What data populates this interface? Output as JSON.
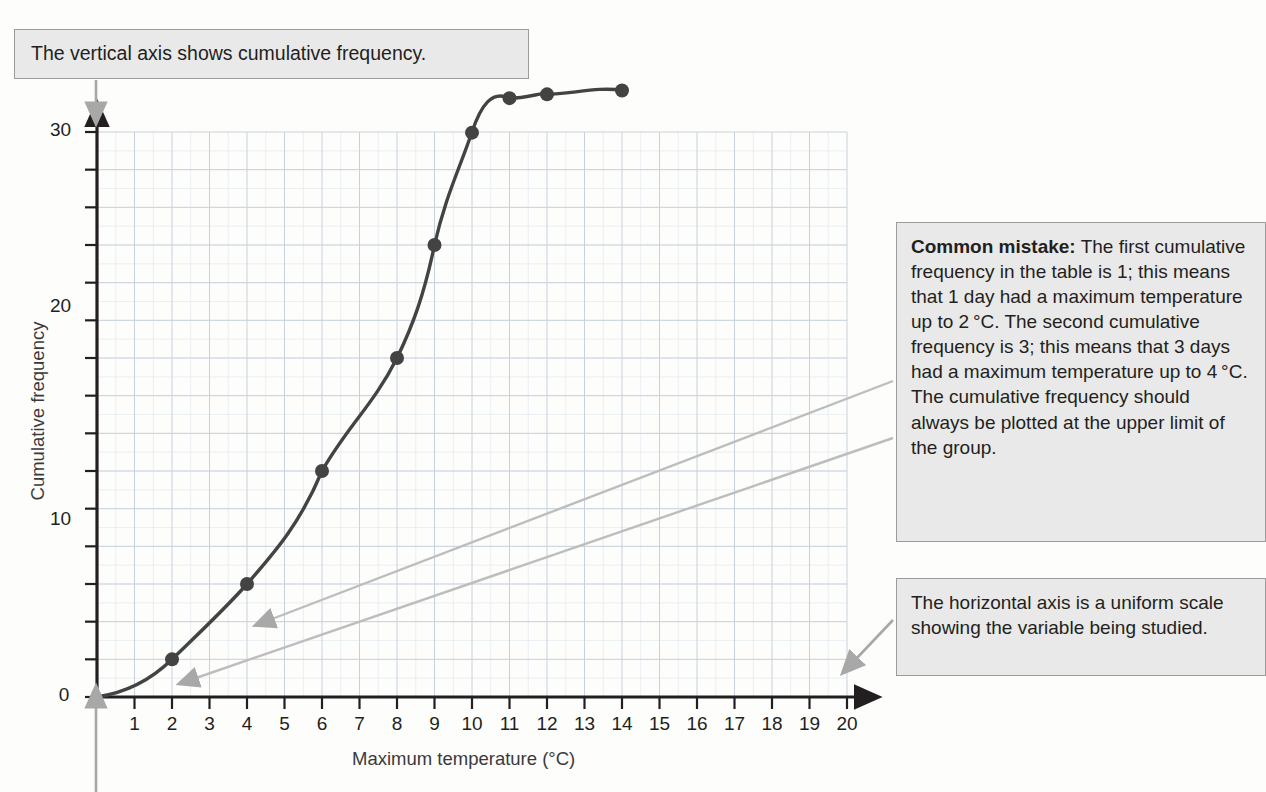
{
  "callouts": {
    "top": "The vertical axis shows cumulative frequency.",
    "mistake_label": "Common mistake:",
    "mistake_body": " The first cumulative frequency in the table is 1; this means that 1 day had a maximum temperature up to 2 °C. The second cumulative frequency is 3; this means that 3 days had a maximum temperature up to 4 °C. The cumulative frequency should always be plotted at the upper limit of the group.",
    "horizontal": "The horizontal axis is a uniform scale showing the variable being studied."
  },
  "chart_data": {
    "type": "line",
    "title": "",
    "xlabel": "Maximum temperature  (°C)",
    "ylabel": "Cumulative frequency",
    "xlim": [
      0,
      20
    ],
    "ylim": [
      0,
      30
    ],
    "xticks": [
      1,
      2,
      3,
      4,
      5,
      6,
      7,
      8,
      9,
      10,
      11,
      12,
      13,
      14,
      15,
      16,
      17,
      18,
      19,
      20
    ],
    "xtick_labels": [
      "1",
      "2",
      "3",
      "4",
      "5",
      "6",
      "7",
      "8",
      "9",
      "10",
      "11",
      "12",
      "13",
      "14",
      "15",
      "16",
      "17",
      "18",
      "19",
      "20"
    ],
    "yticks": [
      0,
      2,
      4,
      6,
      8,
      10,
      12,
      14,
      16,
      18,
      20,
      22,
      24,
      26,
      28,
      30
    ],
    "ytick_labels_major": [
      "0",
      "10",
      "20",
      "30"
    ],
    "ymajor": [
      0,
      10,
      20,
      30
    ],
    "grid": true,
    "grid_color": "#c9d2dc",
    "line_color": "#434343",
    "marker_color": "#434343",
    "legend": "none",
    "x": [
      0,
      2,
      4,
      6,
      8,
      9,
      10,
      11,
      12,
      14,
      16
    ],
    "values": [
      0,
      1,
      3,
      6,
      9,
      12,
      17,
      21,
      26,
      27,
      28
    ],
    "points": [
      {
        "x": 2,
        "y": 1
      },
      {
        "x": 4,
        "y": 3
      },
      {
        "x": 6,
        "y": 6
      },
      {
        "x": 8,
        "y": 9
      },
      {
        "x": 9,
        "y": 12
      },
      {
        "x": 10,
        "y": 17
      },
      {
        "x": 11,
        "y": 21
      },
      {
        "x": 12,
        "y": 26
      },
      {
        "x": 14,
        "y": 27
      },
      {
        "x": 16,
        "y": 28
      }
    ]
  },
  "colors": {
    "callout_fill": "#e9e9e9",
    "callout_border": "#9b9b9b",
    "curve": "#434343",
    "grid": "#c9d2dc",
    "axis": "#231f20",
    "annotation_arrow": "#a8a8a8"
  }
}
